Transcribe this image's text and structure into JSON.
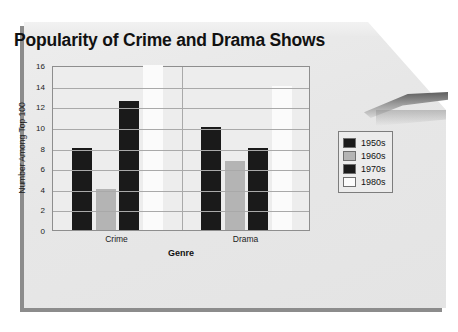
{
  "chart_data": {
    "type": "bar",
    "title": "Popularity of Crime and Drama Shows",
    "xlabel": "Genre",
    "ylabel": "Number Among Top 100",
    "categories": [
      "Crime",
      "Drama"
    ],
    "ylim": [
      0,
      16
    ],
    "yticks": [
      0,
      2,
      4,
      6,
      8,
      10,
      12,
      14,
      16
    ],
    "grid": true,
    "legend_position": "right",
    "series": [
      {
        "name": "1950s",
        "color": "#1a1a1a",
        "values": [
          8,
          10
        ]
      },
      {
        "name": "1960s",
        "color": "#b4b4b4",
        "values": [
          4,
          6.7
        ]
      },
      {
        "name": "1970s",
        "color": "#1a1a1a",
        "values": [
          12.5,
          8
        ]
      },
      {
        "name": "1980s",
        "color": "#fbfbfb",
        "values": [
          16,
          14
        ]
      }
    ]
  },
  "legend": {
    "items": [
      {
        "label": "1950s"
      },
      {
        "label": "1960s"
      },
      {
        "label": "1970s"
      },
      {
        "label": "1980s"
      }
    ]
  }
}
